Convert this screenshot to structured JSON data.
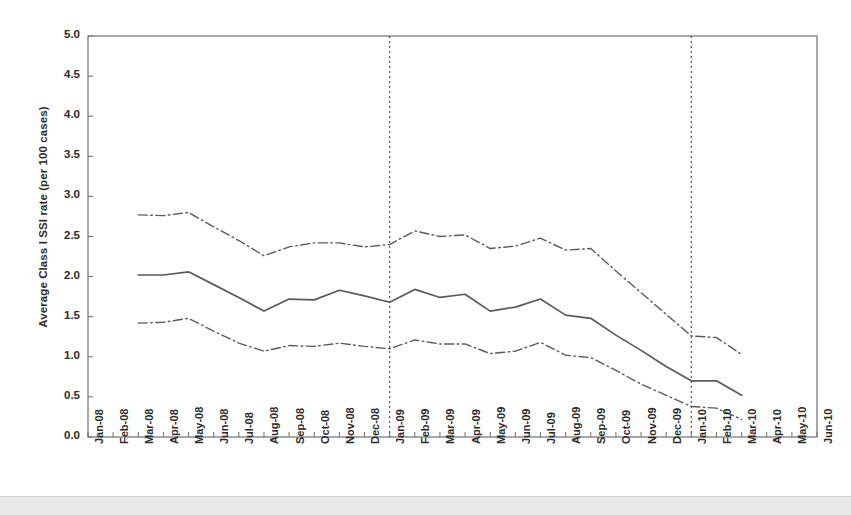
{
  "figure": {
    "y_axis_title": "Average Class I SSI rate (per 100 cases)"
  },
  "chart_data": {
    "type": "line",
    "title": "",
    "subtitle": "",
    "xlabel": "",
    "ylabel": "Average Class I SSI rate (per 100 cases)",
    "ylim": [
      0.0,
      5.0
    ],
    "y_ticks": [
      0.0,
      0.5,
      1.0,
      1.5,
      2.0,
      2.5,
      3.0,
      3.5,
      4.0,
      4.5,
      5.0
    ],
    "y_tick_labels": [
      "0.0",
      "0.5",
      "1.0",
      "1.5",
      "2.0",
      "2.5",
      "3.0",
      "3.5",
      "4.0",
      "4.5",
      "5.0"
    ],
    "grid": false,
    "legend": null,
    "categories": [
      "Jan-08",
      "Feb-08",
      "Mar-08",
      "Apr-08",
      "May-08",
      "Jun-08",
      "Jul-08",
      "Aug-08",
      "Sep-08",
      "Oct-08",
      "Nov-08",
      "Dec-08",
      "Jan-09",
      "Feb-09",
      "Mar-09",
      "Apr-09",
      "May-09",
      "Jun-09",
      "Jul-09",
      "Aug-09",
      "Sep-09",
      "Oct-09",
      "Nov-09",
      "Dec-09",
      "Jan-10",
      "Feb-10",
      "Mar-10",
      "Apr-10",
      "May-10",
      "Jun-10"
    ],
    "series": [
      {
        "name": "Upper confidence limit",
        "style": "dash-dot",
        "values": [
          null,
          null,
          2.77,
          2.76,
          2.8,
          2.62,
          2.45,
          2.26,
          2.37,
          2.42,
          2.42,
          2.37,
          2.4,
          2.57,
          2.5,
          2.52,
          2.35,
          2.38,
          2.48,
          2.33,
          2.35,
          2.07,
          1.8,
          1.53,
          1.26,
          1.24,
          1.03,
          null,
          null,
          null
        ]
      },
      {
        "name": "Average Class I SSI rate",
        "style": "solid",
        "values": [
          null,
          null,
          2.02,
          2.02,
          2.06,
          1.9,
          1.74,
          1.57,
          1.72,
          1.71,
          1.83,
          1.76,
          1.68,
          1.84,
          1.74,
          1.78,
          1.57,
          1.62,
          1.72,
          1.52,
          1.48,
          1.27,
          1.08,
          0.88,
          0.7,
          0.7,
          0.52,
          null,
          null,
          null
        ]
      },
      {
        "name": "Lower confidence limit",
        "style": "dash-dot",
        "values": [
          null,
          null,
          1.42,
          1.43,
          1.48,
          1.32,
          1.17,
          1.07,
          1.14,
          1.13,
          1.17,
          1.13,
          1.1,
          1.21,
          1.16,
          1.16,
          1.04,
          1.07,
          1.18,
          1.02,
          0.99,
          0.83,
          0.66,
          0.52,
          0.38,
          0.36,
          0.22,
          null,
          null,
          null
        ]
      }
    ],
    "reference_lines": [
      {
        "name": "vertical-reference-jan09",
        "x": "Jan-09",
        "style": "dotted",
        "orientation": "vertical"
      },
      {
        "name": "vertical-reference-jan10",
        "x": "Jan-10",
        "style": "dotted",
        "orientation": "vertical"
      }
    ]
  }
}
